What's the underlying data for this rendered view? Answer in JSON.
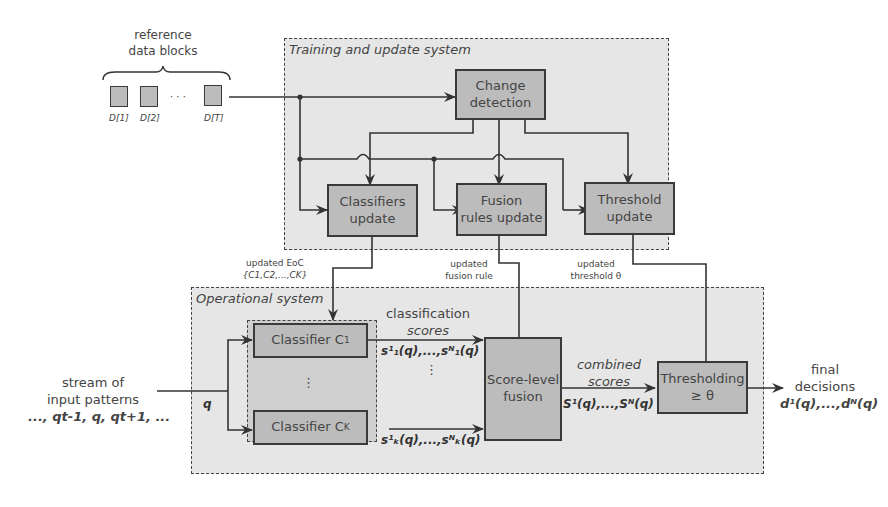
{
  "reference_data": {
    "title_line1": "reference",
    "title_line2": "data blocks",
    "blocks": [
      "D[1]",
      "D[2]",
      "D[T]"
    ],
    "ellipsis": "· · ·"
  },
  "training_system": {
    "title": "Training and update system",
    "change_detection": {
      "line1": "Change",
      "line2": "detection"
    },
    "classifiers_update": {
      "line1": "Classifiers",
      "line2": "update"
    },
    "fusion_rules_update": {
      "line1": "Fusion",
      "line2": "rules update"
    },
    "threshold_update": {
      "line1": "Threshold",
      "line2": "update"
    }
  },
  "transfer_labels": {
    "eoc_line1": "updated EoC",
    "eoc_line2": "{C1,C2,...,CK}",
    "fusion_line1": "updated",
    "fusion_line2": "fusion rule",
    "threshold_line1": "updated",
    "threshold_line2": "threshold θ"
  },
  "operational_system": {
    "title": "Operational system",
    "classifier_1": "Classifier C",
    "classifier_1_sub": "1",
    "classifier_k": "Classifier C",
    "classifier_k_sub": "K",
    "vdots": "⋮",
    "classification_scores_line1": "classification",
    "classification_scores_line2": "scores",
    "score_1": "s¹₁(q),...,sᴺ₁(q)",
    "score_k": "s¹ₖ(q),...,sᴺₖ(q)",
    "score_level_fusion": {
      "line1": "Score-level",
      "line2": "fusion"
    },
    "combined_scores_line1": "combined",
    "combined_scores_line2": "scores",
    "combined_values": "S¹(q),...,Sᴺ(q)",
    "thresholding": {
      "line1": "Thresholding",
      "line2": "≥ θ"
    },
    "q_label": "q"
  },
  "input": {
    "line1": "stream of",
    "line2": "input patterns",
    "line3": "..., qt-1, q, qt+1, ..."
  },
  "output": {
    "line1": "final",
    "line2": "decisions",
    "line3": "d¹(q),...,dᴺ(q)"
  }
}
